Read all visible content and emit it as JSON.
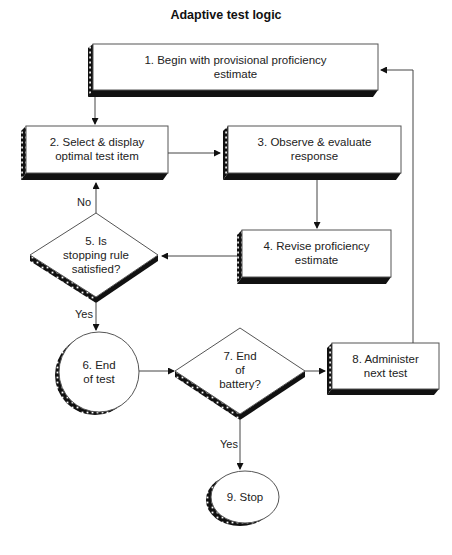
{
  "title": "Adaptive test logic",
  "colors": {
    "line": "#555555",
    "shadow": "#111111",
    "fill": "#ffffff"
  },
  "nodes": [
    {
      "id": 1,
      "shape": "box",
      "line1": "1. Begin with provisional proficiency",
      "line2": "estimate"
    },
    {
      "id": 2,
      "shape": "box",
      "line1": "2. Select & display",
      "line2": "optimal test item"
    },
    {
      "id": 3,
      "shape": "box",
      "line1": "3. Observe & evaluate",
      "line2": "response"
    },
    {
      "id": 4,
      "shape": "box",
      "line1": "4. Revise proficiency",
      "line2": "estimate"
    },
    {
      "id": 5,
      "shape": "diamond",
      "line1": "5. Is",
      "line2": "stopping rule",
      "line3": "satisfied?"
    },
    {
      "id": 6,
      "shape": "circle",
      "line1": "6. End",
      "line2": "of test"
    },
    {
      "id": 7,
      "shape": "diamond",
      "line1": "7. End",
      "line2": "of",
      "line3": "battery?"
    },
    {
      "id": 8,
      "shape": "box",
      "line1": "8. Administer",
      "line2": "next test"
    },
    {
      "id": 9,
      "shape": "ellipse",
      "line1": "9. Stop"
    }
  ],
  "edges": [
    {
      "from": 1,
      "to": 2,
      "label": ""
    },
    {
      "from": 2,
      "to": 3,
      "label": ""
    },
    {
      "from": 3,
      "to": 4,
      "label": ""
    },
    {
      "from": 4,
      "to": 5,
      "label": ""
    },
    {
      "from": 5,
      "to": 2,
      "label": "No"
    },
    {
      "from": 5,
      "to": 6,
      "label": "Yes"
    },
    {
      "from": 6,
      "to": 7,
      "label": ""
    },
    {
      "from": 7,
      "to": 8,
      "label": "No"
    },
    {
      "from": 7,
      "to": 9,
      "label": "Yes"
    },
    {
      "from": 8,
      "to": 1,
      "label": ""
    }
  ]
}
